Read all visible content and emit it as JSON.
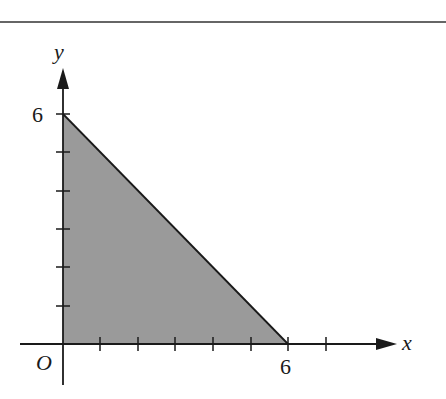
{
  "figure": {
    "top_rule": true,
    "axes": {
      "x_label": "x",
      "y_label": "y",
      "origin_label": "O",
      "x_tick_label": "6",
      "y_tick_label": "6",
      "x_ticks": [
        1,
        2,
        3,
        4,
        5,
        6,
        7
      ],
      "y_ticks": [
        1,
        2,
        3,
        4,
        5,
        6
      ]
    },
    "region": {
      "shape": "triangle",
      "vertices": [
        [
          0,
          0
        ],
        [
          6,
          0
        ],
        [
          0,
          6
        ]
      ],
      "fill_color": "#9a9a9a",
      "boundary": "x + y = 6"
    },
    "colors": {
      "axis": "#1a1a1a",
      "fill": "#9a9a9a",
      "background": "#ffffff"
    }
  }
}
